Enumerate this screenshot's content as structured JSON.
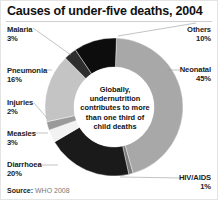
{
  "chart_data": {
    "type": "pie",
    "subtype": "donut",
    "title": "Causes of under-five deaths, 2004",
    "categories": [
      "Neonatal",
      "HIV/AIDS",
      "Diarrhoea",
      "Measles",
      "Injuries",
      "Pneumonia",
      "Malaria",
      "Others"
    ],
    "values": [
      45,
      1,
      20,
      3,
      2,
      16,
      3,
      10
    ],
    "unit": "%",
    "colors": [
      "#a8a8a8",
      "#7a7a7a",
      "#1a1a1a",
      "#f2f2f2",
      "#9a9a9a",
      "#c4c4c4",
      "#2e2e2e",
      "#0d0d0d"
    ],
    "center_annotation": "Globally, undernutrition contributes to more than one third of child deaths",
    "source": "WHO 2008",
    "legend_position": "callout labels around donut"
  },
  "header": {
    "title": "Causes of under-five deaths, 2004"
  },
  "labels": {
    "malaria": {
      "name": "Malaria",
      "pct": "3%"
    },
    "pneumonia": {
      "name": "Pneumonia",
      "pct": "16%"
    },
    "injuries": {
      "name": "Injuries",
      "pct": "2%"
    },
    "measles": {
      "name": "Measles",
      "pct": "3%"
    },
    "diarrhoea": {
      "name": "Diarrhoea",
      "pct": "20%"
    },
    "others": {
      "name": "Others",
      "pct": "10%"
    },
    "neonatal": {
      "name": "Neonatal",
      "pct": "45%"
    },
    "hiv": {
      "name": "HIV/AIDS",
      "pct": "1%"
    }
  },
  "center": {
    "line1": "Globally,",
    "line2": "undernutrition",
    "line3": "contributes to more",
    "line4": "than one third of",
    "line5": "child deaths"
  },
  "footer": {
    "source_label": "Source:",
    "source_value": "WHO 2008"
  }
}
